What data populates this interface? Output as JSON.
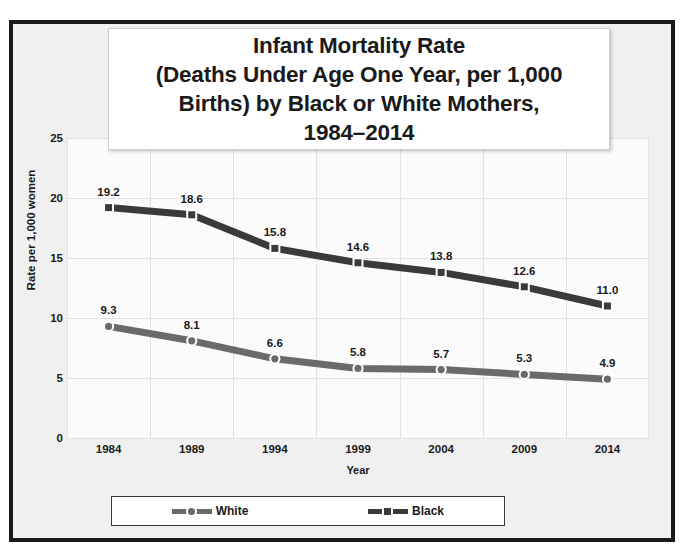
{
  "chart_data": {
    "type": "line",
    "title": "Infant Mortality Rate\n(Deaths Under Age One Year, per 1,000\nBirths) by Black or White Mothers,\n1984–2014",
    "xlabel": "Year",
    "ylabel": "Rate per 1,000 women",
    "categories": [
      "1984",
      "1989",
      "1994",
      "1999",
      "2004",
      "2009",
      "2014"
    ],
    "ylim": [
      0,
      25
    ],
    "yticks": [
      "0",
      "5",
      "10",
      "15",
      "20",
      "25"
    ],
    "ytick_values": [
      0,
      5,
      10,
      15,
      20,
      25
    ],
    "grid": "both",
    "legend_position": "bottom",
    "series": [
      {
        "name": "White",
        "values": [
          9.3,
          8.1,
          6.6,
          5.8,
          5.7,
          5.3,
          4.9
        ],
        "labels": [
          "9.3",
          "8.1",
          "6.6",
          "5.8",
          "5.7",
          "5.3",
          "4.9"
        ],
        "color": "#6a6a6a",
        "marker": "circle"
      },
      {
        "name": "Black",
        "values": [
          19.2,
          18.6,
          15.8,
          14.6,
          13.8,
          12.6,
          11.0
        ],
        "labels": [
          "19.2",
          "18.6",
          "15.8",
          "14.6",
          "13.8",
          "12.6",
          "11.0"
        ],
        "color": "#3a3a3a",
        "marker": "square"
      }
    ]
  },
  "colors": {
    "frame": "#1a1a1a",
    "chart_background": "#f0f0f0",
    "plot_background": "#fbfbfb",
    "gridline": "#e2e2e2",
    "white_series": "#6a6a6a",
    "black_series": "#3a3a3a"
  }
}
